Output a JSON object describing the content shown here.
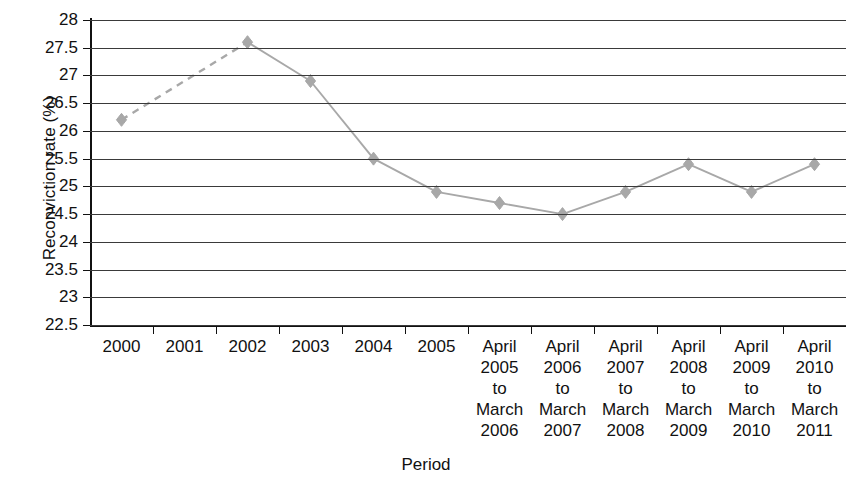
{
  "chart_data": {
    "type": "line",
    "title": "",
    "xlabel": "Period",
    "ylabel": "Reconviction rate (%)",
    "ylim": [
      22.5,
      28
    ],
    "ytick_step": 0.5,
    "grid": true,
    "legend": false,
    "marker": "diamond",
    "series_color": "#a8a8a8",
    "categories": [
      "2000",
      "2001",
      "2002",
      "2003",
      "2004",
      "2005",
      "April 2005 to March 2006",
      "April 2006 to March 2007",
      "April 2007 to March 2008",
      "April 2008 to March 2009",
      "April 2009 to March 2010",
      "April 2010 to March 2011"
    ],
    "values": [
      26.2,
      null,
      27.6,
      26.9,
      25.5,
      24.9,
      24.7,
      24.5,
      24.9,
      25.4,
      24.9,
      25.4
    ],
    "yticks": [
      "28",
      "27.5",
      "27",
      "26.5",
      "26",
      "25.5",
      "25",
      "24.5",
      "24",
      "23.5",
      "23",
      "22.5"
    ],
    "xtick_labels": [
      [
        "2000"
      ],
      [
        "2001"
      ],
      [
        "2002"
      ],
      [
        "2003"
      ],
      [
        "2004"
      ],
      [
        "2005"
      ],
      [
        "April",
        "2005",
        "to",
        "March",
        "2006"
      ],
      [
        "April",
        "2006",
        "to",
        "March",
        "2007"
      ],
      [
        "April",
        "2007",
        "to",
        "March",
        "2008"
      ],
      [
        "April",
        "2008",
        "to",
        "March",
        "2009"
      ],
      [
        "April",
        "2009",
        "to",
        "March",
        "2010"
      ],
      [
        "April",
        "2010",
        "to",
        "March",
        "2011"
      ]
    ]
  }
}
